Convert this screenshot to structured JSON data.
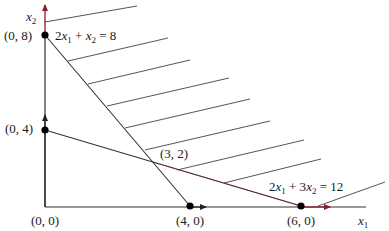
{
  "diagram": {
    "type": "linear-programming-feasible-region",
    "colors": {
      "line": "#333333",
      "accent": "#8b1a2b",
      "point": "#000000",
      "background": "#ffffff"
    },
    "axes": {
      "x_label_var": "x",
      "x_label_sub": "1",
      "y_label_var": "x",
      "y_label_sub": "2"
    },
    "points": [
      {
        "label": "(0, 8)",
        "x": 0,
        "y": 8
      },
      {
        "label": "(0, 4)",
        "x": 0,
        "y": 4
      },
      {
        "label": "(0, 0)",
        "x": 0,
        "y": 0
      },
      {
        "label": "(4, 0)",
        "x": 4,
        "y": 0
      },
      {
        "label": "(6, 0)",
        "x": 6,
        "y": 0
      },
      {
        "label": "(3, 2)",
        "x": 3,
        "y": 2
      }
    ],
    "constraints": [
      {
        "label": "2x1 + x2 = 8",
        "parts": [
          "2",
          "x",
          "1",
          " + ",
          "x",
          "2",
          " = 8"
        ]
      },
      {
        "label": "2x1 + 3x2 = 12",
        "parts": [
          "2",
          "x",
          "1",
          " + 3",
          "x",
          "2",
          " = 12"
        ]
      }
    ],
    "hatch_line_count": 9
  }
}
